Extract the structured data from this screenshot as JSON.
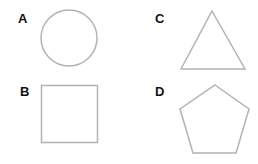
{
  "stroke_color": "#b3b3b3",
  "fill_color": "#ffffff",
  "label_color": "#111111",
  "panels": [
    {
      "id": "A",
      "label": "A",
      "shape": "circle"
    },
    {
      "id": "B",
      "label": "B",
      "shape": "square"
    },
    {
      "id": "C",
      "label": "C",
      "shape": "triangle"
    },
    {
      "id": "D",
      "label": "D",
      "shape": "pentagon"
    }
  ]
}
